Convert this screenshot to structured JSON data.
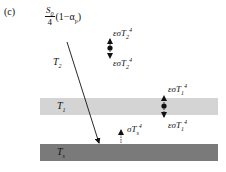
{
  "panel_label": "(c)",
  "solar_input": {
    "numerator": "S",
    "numerator_sub": "0",
    "denominator": "4",
    "factor_open": "(1−α",
    "factor_sub": "p",
    "factor_close": ")"
  },
  "labels": {
    "t2": {
      "base": "T",
      "sub": "2"
    },
    "t1": {
      "base": "T",
      "sub": "1"
    },
    "ts": {
      "base": "T",
      "sub": "s"
    }
  },
  "fluxes": {
    "layer2_up": {
      "prefix": "εσT",
      "sub": "2",
      "sup": "4"
    },
    "layer2_down": {
      "prefix": "εσT",
      "sub": "2",
      "sup": "4"
    },
    "layer1_up": {
      "prefix": "εσT",
      "sub": "1",
      "sup": "4"
    },
    "layer1_down": {
      "prefix": "εσT",
      "sub": "1",
      "sup": "4"
    },
    "surface_up": {
      "prefix": "σT",
      "sub": "s",
      "sup": "4"
    }
  },
  "colors": {
    "layer1_band": "#d4d4d4",
    "surface_band": "#7a7a7a",
    "ink": "#111111"
  }
}
